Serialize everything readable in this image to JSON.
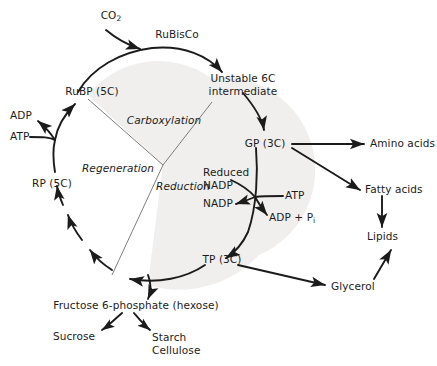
{
  "figure": {
    "type": "biochemical-pathway-diagram",
    "background_color": "#ffffff",
    "shade_color": "#f0efed",
    "stroke_color": "#1b1b1b",
    "text_color": "#1b1b1b"
  },
  "cycle": {
    "phase_labels": [
      {
        "id": "carboxylation",
        "text": "Carboxylation"
      },
      {
        "id": "regeneration",
        "text": "Regeneration"
      },
      {
        "id": "reduction",
        "text": "Reduction"
      }
    ],
    "nodes": [
      {
        "id": "co2",
        "text": "CO",
        "sub": "2"
      },
      {
        "id": "rubisco",
        "text": "RuBisCo"
      },
      {
        "id": "rubp",
        "text": "RuBP  (5C)"
      },
      {
        "id": "unstable_line1",
        "text": "Unstable 6C"
      },
      {
        "id": "unstable_line2",
        "text": "intermediate"
      },
      {
        "id": "gp",
        "text": "GP (3C)"
      },
      {
        "id": "tp",
        "text": "TP (3C)"
      },
      {
        "id": "rp",
        "text": "RP  (5C)"
      },
      {
        "id": "adp",
        "text": "ADP"
      },
      {
        "id": "atp_left",
        "text": "ATP"
      },
      {
        "id": "reduced_nadp_line1",
        "text": "Reduced"
      },
      {
        "id": "reduced_nadp_line2",
        "text": "NADP"
      },
      {
        "id": "nadp",
        "text": "NADP"
      },
      {
        "id": "atp_right",
        "text": "ATP"
      },
      {
        "id": "adp_pi",
        "text": "ADP + P",
        "sub": "i"
      },
      {
        "id": "fructose",
        "text": "Fructose 6-phosphate (hexose)"
      },
      {
        "id": "sucrose",
        "text": "Sucrose"
      },
      {
        "id": "starch",
        "text": "Starch"
      },
      {
        "id": "cellulose",
        "text": "Cellulose"
      },
      {
        "id": "amino_acids",
        "text": "Amino acids"
      },
      {
        "id": "fatty_acids",
        "text": "Fatty acids"
      },
      {
        "id": "lipids",
        "text": "Lipids"
      },
      {
        "id": "glycerol",
        "text": "Glycerol"
      }
    ]
  }
}
